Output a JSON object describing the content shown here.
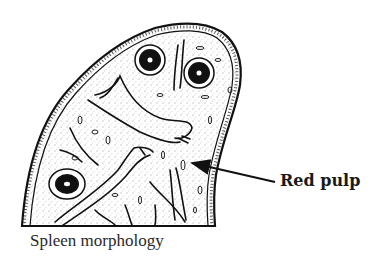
{
  "figure": {
    "subject": "spleen",
    "caption": "Spleen morphology",
    "annotations": [
      {
        "label": "Red pulp",
        "arrow_from": [
          275,
          182
        ],
        "arrow_to": [
          190,
          163
        ]
      }
    ],
    "colors": {
      "ink": "#111111",
      "background": "#ffffff"
    }
  }
}
